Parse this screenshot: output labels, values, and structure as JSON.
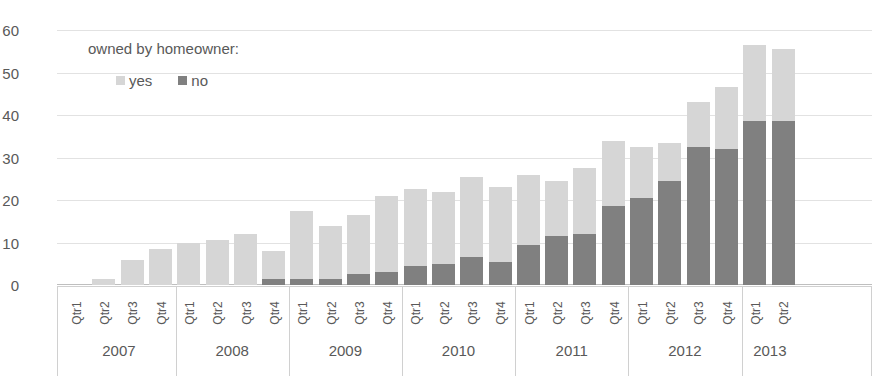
{
  "chart_data": {
    "type": "bar",
    "subtype": "stacked",
    "title": "",
    "xlabel": "",
    "ylabel": "",
    "ylim": [
      0,
      60
    ],
    "yticks": [
      0,
      10,
      20,
      30,
      40,
      50,
      60
    ],
    "grid": true,
    "legend": {
      "title": "owned by homeowner:",
      "position": "top-left-inside",
      "entries": [
        {
          "name": "yes",
          "color": "#d6d6d6"
        },
        {
          "name": "no",
          "color": "#808080"
        }
      ]
    },
    "categories": [
      "Qtr1",
      "Qtr2",
      "Qtr3",
      "Qtr4",
      "Qtr1",
      "Qtr2",
      "Qtr3",
      "Qtr4",
      "Qtr1",
      "Qtr2",
      "Qtr3",
      "Qtr4",
      "Qtr1",
      "Qtr2",
      "Qtr3",
      "Qtr4",
      "Qtr1",
      "Qtr2",
      "Qtr3",
      "Qtr4",
      "Qtr1",
      "Qtr2",
      "Qtr3",
      "Qtr4",
      "Qtr1",
      "Qtr2"
    ],
    "group_labels": [
      "2007",
      "2008",
      "2009",
      "2010",
      "2011",
      "2012",
      "2013"
    ],
    "group_sizes": [
      4,
      4,
      4,
      4,
      4,
      4,
      2
    ],
    "series": [
      {
        "name": "no",
        "color": "#808080",
        "values": [
          0,
          0,
          0,
          0,
          0,
          0,
          0,
          1.5,
          1.5,
          1.5,
          2.5,
          3,
          4.5,
          5,
          6.5,
          5.5,
          9.5,
          11.5,
          12,
          18.5,
          20.5,
          24.5,
          32.5,
          32,
          38.5,
          38.5
        ]
      },
      {
        "name": "yes",
        "color": "#d6d6d6",
        "values": [
          0,
          1.5,
          6,
          8.5,
          10,
          10.5,
          12,
          6.5,
          16,
          12.5,
          14,
          18,
          18,
          17,
          19,
          17.5,
          16.5,
          13,
          15.5,
          15.5,
          12,
          9,
          10.5,
          14.5,
          18,
          17
        ]
      }
    ],
    "totals": [
      0,
      1.5,
      6,
      8.5,
      10,
      10.5,
      12,
      8,
      17.5,
      14,
      16.5,
      21,
      22.5,
      22,
      25.5,
      23,
      26,
      24.5,
      27.5,
      34,
      32.5,
      33.5,
      43,
      46.5,
      56.5,
      55.5
    ]
  }
}
